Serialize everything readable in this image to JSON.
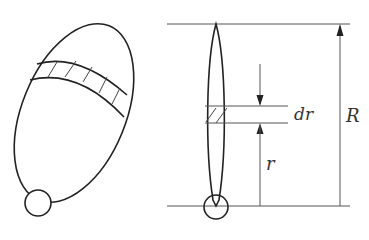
{
  "diagram": {
    "left_figure": {
      "description": "tilted elliptical disk with hatched annular strip and small circle at bottom"
    },
    "right_figure": {
      "description": "edge-on view of disk with hatched strip of thickness dr at radius r, total radius R"
    },
    "labels": {
      "dr": "dr",
      "R": "R",
      "r": "r"
    },
    "colors": {
      "stroke": "#222222",
      "guide": "#555555",
      "background": "#ffffff"
    }
  }
}
